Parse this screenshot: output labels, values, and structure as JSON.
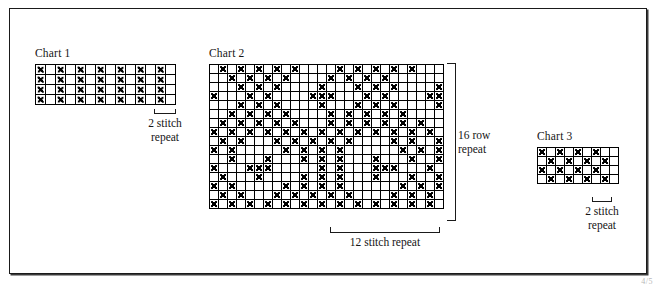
{
  "page": {
    "background": "#ffffff",
    "frame_color": "#1a1a1a",
    "symbol_color": "#000000",
    "corner_mark": "4/5"
  },
  "charts": [
    {
      "id": "chart-1",
      "title": "Chart 1",
      "cols": 14,
      "rows": 4,
      "cell_px": 10,
      "caption": "2 stitch\nrepeat",
      "repeat_stitches": 2,
      "grid": [
        [
          1,
          0,
          1,
          0,
          1,
          0,
          1,
          0,
          1,
          0,
          1,
          0,
          1,
          0
        ],
        [
          1,
          0,
          1,
          0,
          1,
          0,
          1,
          0,
          1,
          0,
          1,
          0,
          1,
          0
        ],
        [
          1,
          0,
          1,
          0,
          1,
          0,
          1,
          0,
          1,
          0,
          1,
          0,
          1,
          0
        ],
        [
          1,
          0,
          1,
          0,
          1,
          0,
          1,
          0,
          1,
          0,
          1,
          0,
          1,
          0
        ]
      ]
    },
    {
      "id": "chart-2",
      "title": "Chart 2",
      "cols": 26,
      "rows": 16,
      "cell_px": 9,
      "caption_bottom": "12 stitch repeat",
      "caption_right": "16 row\nrepeat",
      "repeat_stitches": 12,
      "repeat_rows": 16,
      "grid": [
        [
          0,
          1,
          0,
          1,
          0,
          1,
          0,
          1,
          0,
          1,
          0,
          0,
          0,
          0,
          1,
          0,
          1,
          0,
          1,
          0,
          1,
          0,
          1,
          0,
          0,
          0
        ],
        [
          0,
          0,
          1,
          0,
          1,
          0,
          1,
          0,
          1,
          0,
          0,
          0,
          0,
          1,
          0,
          1,
          0,
          1,
          0,
          1,
          0,
          0,
          0,
          0,
          0,
          0
        ],
        [
          0,
          0,
          0,
          1,
          0,
          1,
          0,
          1,
          0,
          0,
          0,
          0,
          1,
          0,
          0,
          0,
          1,
          0,
          1,
          0,
          1,
          0,
          0,
          0,
          0,
          1
        ],
        [
          1,
          0,
          0,
          0,
          1,
          0,
          1,
          0,
          0,
          0,
          0,
          1,
          1,
          1,
          0,
          0,
          0,
          1,
          0,
          1,
          0,
          0,
          0,
          0,
          1,
          1
        ],
        [
          0,
          0,
          0,
          1,
          0,
          1,
          0,
          1,
          0,
          0,
          0,
          0,
          1,
          0,
          0,
          0,
          1,
          0,
          1,
          0,
          1,
          0,
          0,
          0,
          0,
          1
        ],
        [
          0,
          0,
          1,
          0,
          1,
          0,
          1,
          0,
          1,
          0,
          0,
          0,
          0,
          1,
          0,
          1,
          0,
          1,
          0,
          1,
          0,
          1,
          0,
          0,
          0,
          0
        ],
        [
          0,
          1,
          0,
          1,
          0,
          1,
          0,
          1,
          0,
          1,
          0,
          0,
          0,
          1,
          0,
          1,
          0,
          1,
          0,
          1,
          0,
          1,
          0,
          1,
          0,
          0
        ],
        [
          1,
          0,
          1,
          0,
          1,
          0,
          1,
          0,
          1,
          0,
          1,
          0,
          1,
          0,
          1,
          0,
          1,
          0,
          1,
          0,
          1,
          0,
          1,
          0,
          1,
          0
        ],
        [
          0,
          1,
          0,
          1,
          0,
          0,
          0,
          1,
          0,
          1,
          0,
          1,
          0,
          1,
          0,
          1,
          0,
          0,
          0,
          0,
          1,
          0,
          1,
          0,
          0,
          1
        ],
        [
          1,
          0,
          1,
          0,
          0,
          0,
          0,
          0,
          1,
          0,
          1,
          0,
          1,
          0,
          1,
          0,
          0,
          0,
          0,
          0,
          0,
          1,
          0,
          1,
          0,
          1
        ],
        [
          0,
          0,
          1,
          0,
          0,
          0,
          1,
          0,
          0,
          0,
          1,
          0,
          1,
          0,
          1,
          0,
          0,
          0,
          1,
          0,
          0,
          0,
          1,
          0,
          0,
          1
        ],
        [
          1,
          0,
          0,
          0,
          1,
          1,
          1,
          0,
          0,
          0,
          0,
          0,
          1,
          0,
          1,
          0,
          0,
          0,
          1,
          1,
          1,
          0,
          0,
          0,
          1,
          0
        ],
        [
          0,
          1,
          0,
          0,
          0,
          1,
          0,
          0,
          0,
          0,
          1,
          0,
          1,
          0,
          1,
          0,
          0,
          0,
          1,
          0,
          0,
          0,
          1,
          0,
          0,
          1
        ],
        [
          1,
          0,
          1,
          0,
          0,
          0,
          0,
          0,
          1,
          0,
          1,
          0,
          1,
          0,
          1,
          0,
          0,
          0,
          0,
          0,
          0,
          1,
          0,
          1,
          0,
          1
        ],
        [
          0,
          1,
          0,
          1,
          0,
          0,
          0,
          1,
          0,
          1,
          0,
          1,
          0,
          1,
          0,
          1,
          0,
          0,
          0,
          0,
          1,
          0,
          1,
          0,
          1,
          0
        ],
        [
          1,
          0,
          1,
          0,
          1,
          0,
          1,
          0,
          1,
          0,
          1,
          0,
          1,
          0,
          1,
          0,
          1,
          0,
          1,
          0,
          1,
          0,
          1,
          0,
          1,
          0
        ]
      ]
    },
    {
      "id": "chart-3",
      "title": "Chart 3",
      "cols": 9,
      "rows": 4,
      "cell_px": 9,
      "caption": "2 stitch\nrepeat",
      "repeat_stitches": 2,
      "grid": [
        [
          1,
          0,
          1,
          0,
          1,
          0,
          1,
          0,
          0
        ],
        [
          0,
          1,
          0,
          1,
          0,
          1,
          0,
          1,
          0
        ],
        [
          1,
          0,
          1,
          0,
          1,
          0,
          1,
          0,
          0
        ],
        [
          0,
          1,
          0,
          1,
          0,
          1,
          0,
          1,
          0
        ]
      ]
    }
  ],
  "chart_data": {
    "type": "heatmap",
    "legend": [
      {
        "symbol": "X",
        "meaning": "marked stitch"
      },
      {
        "symbol": "",
        "meaning": "empty stitch"
      }
    ],
    "grids": [
      {
        "name": "Chart 1",
        "cols": 14,
        "rows": 4,
        "repeat_label": "2 stitch repeat",
        "values": [
          [
            1,
            0,
            1,
            0,
            1,
            0,
            1,
            0,
            1,
            0,
            1,
            0,
            1,
            0
          ],
          [
            1,
            0,
            1,
            0,
            1,
            0,
            1,
            0,
            1,
            0,
            1,
            0,
            1,
            0
          ],
          [
            1,
            0,
            1,
            0,
            1,
            0,
            1,
            0,
            1,
            0,
            1,
            0,
            1,
            0
          ],
          [
            1,
            0,
            1,
            0,
            1,
            0,
            1,
            0,
            1,
            0,
            1,
            0,
            1,
            0
          ]
        ]
      },
      {
        "name": "Chart 2",
        "cols": 26,
        "rows": 16,
        "repeat_label_x": "12 stitch repeat",
        "repeat_label_y": "16 row repeat",
        "values": [
          [
            0,
            1,
            0,
            1,
            0,
            1,
            0,
            1,
            0,
            1,
            0,
            0,
            0,
            0,
            1,
            0,
            1,
            0,
            1,
            0,
            1,
            0,
            1,
            0,
            0,
            0
          ],
          [
            0,
            0,
            1,
            0,
            1,
            0,
            1,
            0,
            1,
            0,
            0,
            0,
            0,
            1,
            0,
            1,
            0,
            1,
            0,
            1,
            0,
            0,
            0,
            0,
            0,
            0
          ],
          [
            0,
            0,
            0,
            1,
            0,
            1,
            0,
            1,
            0,
            0,
            0,
            0,
            1,
            0,
            0,
            0,
            1,
            0,
            1,
            0,
            1,
            0,
            0,
            0,
            0,
            1
          ],
          [
            1,
            0,
            0,
            0,
            1,
            0,
            1,
            0,
            0,
            0,
            0,
            1,
            1,
            1,
            0,
            0,
            0,
            1,
            0,
            1,
            0,
            0,
            0,
            0,
            1,
            1
          ],
          [
            0,
            0,
            0,
            1,
            0,
            1,
            0,
            1,
            0,
            0,
            0,
            0,
            1,
            0,
            0,
            0,
            1,
            0,
            1,
            0,
            1,
            0,
            0,
            0,
            0,
            1
          ],
          [
            0,
            0,
            1,
            0,
            1,
            0,
            1,
            0,
            1,
            0,
            0,
            0,
            0,
            1,
            0,
            1,
            0,
            1,
            0,
            1,
            0,
            1,
            0,
            0,
            0,
            0
          ],
          [
            0,
            1,
            0,
            1,
            0,
            1,
            0,
            1,
            0,
            1,
            0,
            0,
            0,
            1,
            0,
            1,
            0,
            1,
            0,
            1,
            0,
            1,
            0,
            1,
            0,
            0
          ],
          [
            1,
            0,
            1,
            0,
            1,
            0,
            1,
            0,
            1,
            0,
            1,
            0,
            1,
            0,
            1,
            0,
            1,
            0,
            1,
            0,
            1,
            0,
            1,
            0,
            1,
            0
          ],
          [
            0,
            1,
            0,
            1,
            0,
            0,
            0,
            1,
            0,
            1,
            0,
            1,
            0,
            1,
            0,
            1,
            0,
            0,
            0,
            0,
            1,
            0,
            1,
            0,
            0,
            1
          ],
          [
            1,
            0,
            1,
            0,
            0,
            0,
            0,
            0,
            1,
            0,
            1,
            0,
            1,
            0,
            1,
            0,
            0,
            0,
            0,
            0,
            0,
            1,
            0,
            1,
            0,
            1
          ],
          [
            0,
            0,
            1,
            0,
            0,
            0,
            1,
            0,
            0,
            0,
            1,
            0,
            1,
            0,
            1,
            0,
            0,
            0,
            1,
            0,
            0,
            0,
            1,
            0,
            0,
            1
          ],
          [
            1,
            0,
            0,
            0,
            1,
            1,
            1,
            0,
            0,
            0,
            0,
            0,
            1,
            0,
            1,
            0,
            0,
            0,
            1,
            1,
            1,
            0,
            0,
            0,
            1,
            0
          ],
          [
            0,
            1,
            0,
            0,
            0,
            1,
            0,
            0,
            0,
            0,
            1,
            0,
            1,
            0,
            1,
            0,
            0,
            0,
            1,
            0,
            0,
            0,
            1,
            0,
            0,
            1
          ],
          [
            1,
            0,
            1,
            0,
            0,
            0,
            0,
            0,
            1,
            0,
            1,
            0,
            1,
            0,
            1,
            0,
            0,
            0,
            0,
            0,
            0,
            1,
            0,
            1,
            0,
            1
          ],
          [
            0,
            1,
            0,
            1,
            0,
            0,
            0,
            1,
            0,
            1,
            0,
            1,
            0,
            1,
            0,
            1,
            0,
            0,
            0,
            0,
            1,
            0,
            1,
            0,
            1,
            0
          ],
          [
            1,
            0,
            1,
            0,
            1,
            0,
            1,
            0,
            1,
            0,
            1,
            0,
            1,
            0,
            1,
            0,
            1,
            0,
            1,
            0,
            1,
            0,
            1,
            0,
            1,
            0
          ]
        ]
      },
      {
        "name": "Chart 3",
        "cols": 9,
        "rows": 4,
        "repeat_label": "2 stitch repeat",
        "values": [
          [
            1,
            0,
            1,
            0,
            1,
            0,
            1,
            0,
            0
          ],
          [
            0,
            1,
            0,
            1,
            0,
            1,
            0,
            1,
            0
          ],
          [
            1,
            0,
            1,
            0,
            1,
            0,
            1,
            0,
            0
          ],
          [
            0,
            1,
            0,
            1,
            0,
            1,
            0,
            1,
            0
          ]
        ]
      }
    ]
  }
}
